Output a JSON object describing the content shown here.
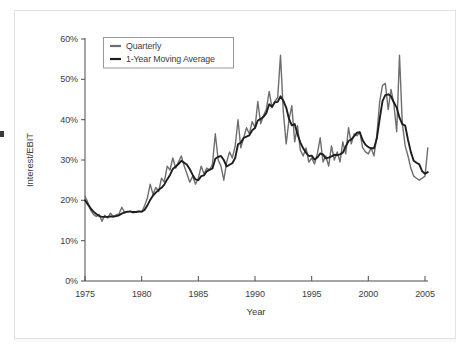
{
  "page": {
    "background": "#ffffff",
    "card_border_color": "#e2e2e0"
  },
  "chart_data": {
    "type": "line",
    "title": "",
    "xlabel": "Year",
    "ylabel": "Interest/EBIT",
    "xlim": [
      1975,
      2005
    ],
    "ylim": [
      0,
      60
    ],
    "grid": false,
    "xtick_values": [
      1975,
      1980,
      1985,
      1990,
      1995,
      2000,
      2005
    ],
    "xtick_labels": [
      "1975",
      "1980",
      "1985",
      "1990",
      "1995",
      "2000",
      "2005"
    ],
    "ytick_values": [
      0,
      10,
      20,
      30,
      40,
      50,
      60
    ],
    "ytick_labels": [
      "0%",
      "10%",
      "20%",
      "30%",
      "40%",
      "50%",
      "60%"
    ],
    "axis_color": "#4d4d4d",
    "legend": {
      "position": "top-left",
      "border_color": "#9a9a9a",
      "entries": [
        {
          "label": "Quarterly",
          "color": "#6e6e6e"
        },
        {
          "label": "1-Year Moving Average",
          "color": "#1e1e1e"
        }
      ]
    },
    "series": [
      {
        "name": "Quarterly",
        "color": "#6e6e6e",
        "stroke_width": 1.4,
        "x_start": 1975,
        "x_step": 0.25,
        "values": [
          21,
          19.5,
          17.5,
          16.5,
          16,
          16.5,
          14.8,
          16.3,
          15.6,
          16.8,
          15.9,
          16.4,
          16.6,
          18.3,
          16.9,
          17.1,
          17.3,
          16.9,
          17.1,
          17.4,
          17.1,
          18.6,
          20.5,
          24,
          21.5,
          23.2,
          22.2,
          25.5,
          24.5,
          28.5,
          27.5,
          30.5,
          28,
          29.5,
          31,
          28.5,
          26.5,
          24.5,
          26,
          24,
          25.5,
          28.5,
          26.5,
          28,
          27.5,
          29,
          36.5,
          30,
          28.5,
          25,
          29.5,
          32,
          30.5,
          33.5,
          40,
          33,
          35.5,
          38,
          36.5,
          39.5,
          38,
          44.5,
          39,
          41,
          42.5,
          47,
          43,
          44.5,
          45.5,
          56,
          42,
          34,
          40,
          43.5,
          34.5,
          38.5,
          32.5,
          31,
          33,
          29.5,
          30.5,
          29,
          31.5,
          35.5,
          29.5,
          31,
          28.5,
          33.5,
          30,
          32,
          29.5,
          34.5,
          31.5,
          38,
          34,
          36.5,
          36,
          37,
          33,
          32,
          31.5,
          33,
          31,
          36,
          44.5,
          48.5,
          49,
          42.5,
          47.5,
          44,
          37,
          56,
          39,
          33.5,
          31,
          28,
          26,
          25.5,
          25,
          25.5,
          26,
          33
        ]
      },
      {
        "name": "1-Year Moving Average",
        "color": "#1e1e1e",
        "stroke_width": 1.9,
        "x_start": 1975,
        "x_step": 0.25,
        "values": [
          20,
          19,
          18,
          17.2,
          16.6,
          16.1,
          15.9,
          15.9,
          15.9,
          16,
          16,
          16.1,
          16.3,
          16.7,
          17,
          17.2,
          17.2,
          17.1,
          17.1,
          17.2,
          17.2,
          17.6,
          18.7,
          20.1,
          21.2,
          21.9,
          22.6,
          23.1,
          23.9,
          25.2,
          26.3,
          27.8,
          28.4,
          29,
          29.8,
          29.3,
          28.8,
          27.7,
          26.3,
          25.2,
          25,
          26,
          26.2,
          27.2,
          27.6,
          27.9,
          30.3,
          30.8,
          31,
          30,
          28.4,
          28.8,
          29.2,
          30.5,
          33.9,
          34.3,
          35.5,
          35.8,
          36.1,
          37.4,
          37.9,
          39.8,
          40.2,
          40.7,
          41.6,
          43.8,
          43.2,
          44.3,
          44.4,
          45.8,
          44.7,
          43,
          40.2,
          38.6,
          38.9,
          36.4,
          34.4,
          32.9,
          31.8,
          31,
          31.1,
          30.1,
          30.6,
          31.6,
          31.4,
          30.4,
          30.6,
          30.9,
          31.3,
          31.2,
          31.4,
          31.8,
          33.3,
          34.7,
          35.1,
          35.9,
          36.8,
          36.9,
          34.9,
          33.8,
          33.2,
          32.9,
          32.9,
          35.3,
          40.2,
          44.6,
          46.1,
          46.3,
          45.8,
          44.3,
          43,
          40.5,
          38.9,
          38.5,
          35,
          32,
          29.8,
          29.3,
          28.9,
          27.2,
          26.6,
          27
        ]
      }
    ]
  }
}
